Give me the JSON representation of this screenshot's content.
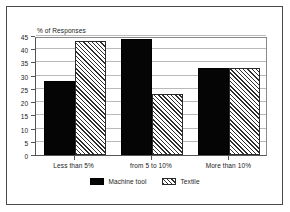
{
  "chart_data": {
    "type": "bar",
    "title": "",
    "ylabel": "% of Responses",
    "xlabel": "",
    "categories": [
      "Less than 5%",
      "from 5 to 10%",
      "More than 10%"
    ],
    "series": [
      {
        "name": "Machine tool",
        "values": [
          28,
          44,
          33
        ],
        "color": "#050505",
        "fill": "solid"
      },
      {
        "name": "Textile",
        "values": [
          43,
          23,
          33
        ],
        "color": "#2e2e2e",
        "fill": "diagonal-hatch"
      }
    ],
    "ylim": [
      0,
      45
    ],
    "yticks": [
      0,
      5,
      10,
      15,
      20,
      25,
      30,
      35,
      40,
      45
    ],
    "ytick_labels": [
      "0",
      "5",
      "10",
      "15",
      "20",
      "25",
      "30",
      "35",
      "40",
      "45"
    ],
    "grid": true,
    "grid_axis": "y",
    "legend_position": "bottom"
  },
  "legend": {
    "items": [
      {
        "label": "Machine tool",
        "swatch": "solid-black-swatch"
      },
      {
        "label": "Textile",
        "swatch": "hatched-swatch"
      }
    ]
  }
}
